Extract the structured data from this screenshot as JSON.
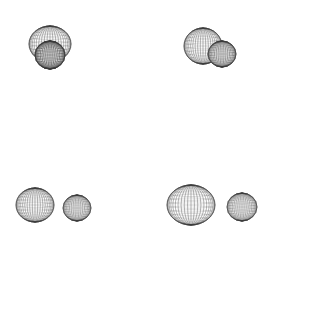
{
  "figure": {
    "title": "",
    "background_color": "#ffffff",
    "width": 325,
    "height": 333,
    "render_style": "wireframe-mesh-sphere",
    "stroke_color": "#3a3a3a",
    "fill_color": "#ffffff"
  },
  "chart_data": {
    "type": "scatter",
    "title": "",
    "subtitle": "",
    "xlabel": "",
    "ylabel": "",
    "grid": false,
    "legend": null,
    "axis_visible": false,
    "tick_labels": [],
    "annotations": [],
    "panels": [
      {
        "id": "panel-top-left",
        "label": "",
        "row": 0,
        "column": 0,
        "overlap": "high",
        "spheres": [
          {
            "name": "sphere-a",
            "cx": 50,
            "cy": 44,
            "rx": 21,
            "ry": 18,
            "shade": "light"
          },
          {
            "name": "sphere-b",
            "cx": 50,
            "cy": 55,
            "rx": 15,
            "ry": 14,
            "shade": "dark"
          }
        ]
      },
      {
        "id": "panel-top-right",
        "label": "",
        "row": 0,
        "column": 1,
        "overlap": "partial",
        "spheres": [
          {
            "name": "sphere-a",
            "cx": 203,
            "cy": 46,
            "rx": 19,
            "ry": 18,
            "shade": "light"
          },
          {
            "name": "sphere-b",
            "cx": 222,
            "cy": 54,
            "rx": 14,
            "ry": 13,
            "shade": "medium"
          }
        ]
      },
      {
        "id": "panel-bottom-left",
        "label": "",
        "row": 1,
        "column": 0,
        "overlap": "none",
        "spheres": [
          {
            "name": "sphere-a",
            "cx": 35,
            "cy": 205,
            "rx": 19,
            "ry": 17,
            "shade": "light"
          },
          {
            "name": "sphere-b",
            "cx": 77,
            "cy": 208,
            "rx": 14,
            "ry": 13,
            "shade": "light"
          }
        ]
      },
      {
        "id": "panel-bottom-right",
        "label": "",
        "row": 1,
        "column": 1,
        "overlap": "none",
        "spheres": [
          {
            "name": "sphere-a",
            "cx": 191,
            "cy": 205,
            "rx": 24,
            "ry": 20,
            "shade": "light"
          },
          {
            "name": "sphere-b",
            "cx": 242,
            "cy": 207,
            "rx": 15,
            "ry": 14,
            "shade": "light"
          }
        ]
      }
    ]
  }
}
